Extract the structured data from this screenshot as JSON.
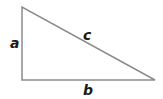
{
  "diagram": {
    "type": "right-triangle",
    "stroke_color": "#8c8c8c",
    "label_color": "#1a1a1a",
    "vertices": {
      "top": [
        22,
        7
      ],
      "right_angle": [
        22,
        80
      ],
      "right": [
        155,
        80
      ]
    },
    "labels": {
      "a": "a",
      "b": "b",
      "c": "c"
    }
  }
}
